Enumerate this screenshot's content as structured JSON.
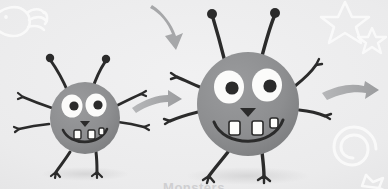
{
  "canvas": {
    "width": 388,
    "height": 189,
    "background_color": "#ececed",
    "paper_tint_color": "#f2f2f3"
  },
  "palette": {
    "monster_body": "#8f9092",
    "monster_body_shadow": "#7e7f81",
    "monster_outline": "#2b2b2b",
    "eye_white": "#fbfbfa",
    "pupil": "#2b2b2b",
    "tooth": "#fdfdfb",
    "arrow_gray": "#a6a7a9",
    "doodle_white": "#fafafa",
    "ground_shadow": "#dcdcdd",
    "caption_text": "#cfcfd1"
  },
  "decorations": [
    {
      "name": "fish-doodle",
      "style": "white-outline",
      "position": "top-left"
    },
    {
      "name": "star-large-doodle",
      "style": "white-outline",
      "position": "top-right"
    },
    {
      "name": "star-small-doodle",
      "style": "white-outline",
      "position": "top-right"
    },
    {
      "name": "spiral-doodle",
      "style": "white-outline",
      "position": "bottom-right"
    },
    {
      "name": "star-corner-doodle",
      "style": "white-outline",
      "position": "bottom-right-corner"
    }
  ],
  "arrows": [
    {
      "name": "arrow-down-curved",
      "direction": "down-right",
      "color": "#a6a7a9"
    },
    {
      "name": "arrow-right-middle",
      "direction": "right",
      "color": "#a6a7a9"
    },
    {
      "name": "arrow-right-far",
      "direction": "right",
      "color": "#a6a7a9"
    }
  ],
  "characters": [
    {
      "id": "small-monster",
      "label": "Small monster",
      "size": "small",
      "antennae": 2,
      "eyes": 2,
      "teeth": 3,
      "arms": 4,
      "legs": 2,
      "expression": "smiling",
      "body_color": "#8f9092"
    },
    {
      "id": "large-monster",
      "label": "Large monster",
      "size": "large",
      "antennae": 2,
      "eyes": 2,
      "teeth": 3,
      "arms": 4,
      "legs": 2,
      "expression": "smiling",
      "body_color": "#8f9092"
    }
  ],
  "caption": {
    "text": "Monsters"
  }
}
